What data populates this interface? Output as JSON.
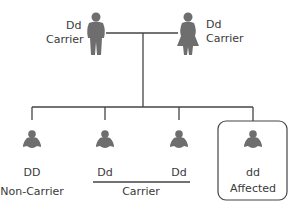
{
  "parents": {
    "father": {
      "genotype": "Dd",
      "status": "Carrier"
    },
    "mother": {
      "genotype": "Dd",
      "status": "Carrier"
    }
  },
  "children": [
    {
      "genotype": "DD",
      "status": "Non-Carrier"
    },
    {
      "genotype": "Dd",
      "status": ""
    },
    {
      "genotype": "Dd",
      "status": ""
    },
    {
      "genotype": "dd",
      "status": "Affected"
    }
  ],
  "carrier_group_label": "Carrier",
  "colors": {
    "figure": "#6e6e6e",
    "line": "#444444"
  }
}
